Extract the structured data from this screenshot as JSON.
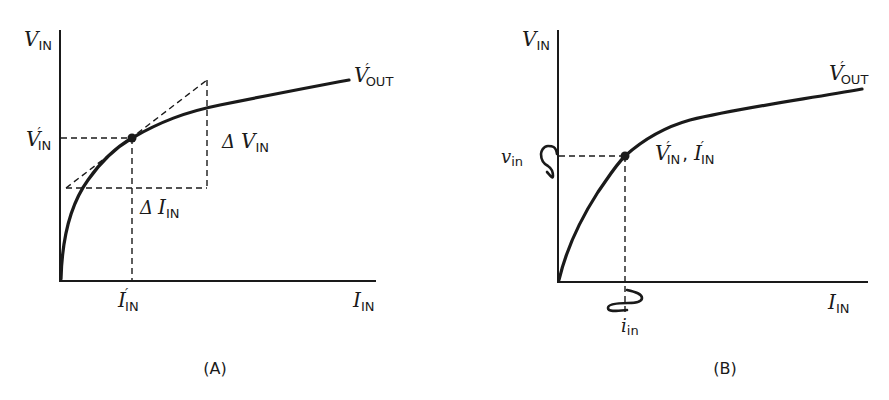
{
  "panel_a": {
    "caption": "(A)",
    "y_axis_label": {
      "main": "V",
      "sub": "IN"
    },
    "x_axis_label": {
      "main": "I",
      "sub": "IN"
    },
    "curve_label": {
      "main": "V",
      "prime": "′",
      "sub": "OUT"
    },
    "operating_v_label": {
      "main": "V",
      "prime": "′",
      "sub": "IN"
    },
    "operating_i_label": {
      "main": "I",
      "prime": "′",
      "sub": "IN"
    },
    "delta_v_label": {
      "delta": "Δ",
      "main": "V",
      "sub": "IN"
    },
    "delta_i_label": {
      "delta": "Δ",
      "main": "I",
      "sub": "IN"
    }
  },
  "panel_b": {
    "caption": "(B)",
    "y_axis_label": {
      "main": "V",
      "sub": "IN"
    },
    "x_axis_label": {
      "main": "I",
      "sub": "IN"
    },
    "curve_label": {
      "main": "V",
      "prime": "′",
      "sub": "OUT"
    },
    "operating_point_label": {
      "v_main": "V",
      "v_prime": "′",
      "v_sub": "IN",
      "sep": ",",
      "i_main": "I",
      "i_prime": "′",
      "i_sub": "IN"
    },
    "small_signal_v_label": {
      "main": "v",
      "sub": "in"
    },
    "small_signal_i_label": {
      "main": "i",
      "sub": "in"
    }
  }
}
